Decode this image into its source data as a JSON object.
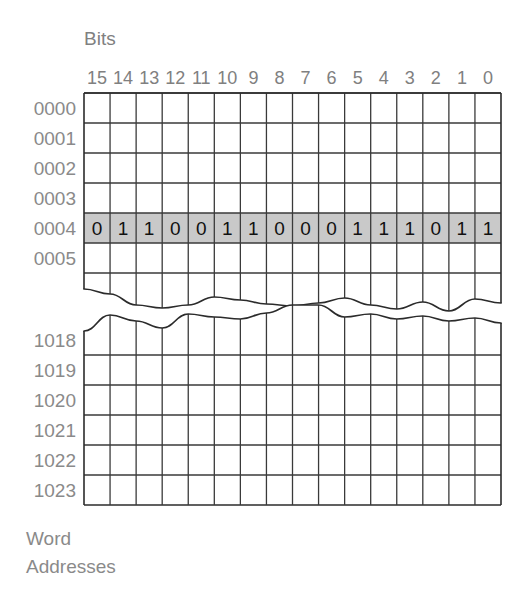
{
  "figure": {
    "bits_header": "Bits",
    "word_addresses_label_line1": "Word",
    "word_addresses_label_line2": "Addresses"
  },
  "colors": {
    "background": "#ffffff",
    "grid_line": "#3a3a3a",
    "outer_line": "#2b2b2b",
    "highlight_fill": "#c9c9c9",
    "label_text": "#8a8a8a",
    "bit_text": "#111111"
  },
  "bit_numbers": [
    "15",
    "14",
    "13",
    "12",
    "11",
    "10",
    "9",
    "8",
    "7",
    "6",
    "5",
    "4",
    "3",
    "2",
    "1",
    "0"
  ],
  "top_block": {
    "addresses": [
      "0000",
      "0001",
      "0002",
      "0003",
      "0004",
      "0005"
    ],
    "highlighted_address": "0004",
    "highlighted_row_index": 4,
    "highlighted_bits": [
      "0",
      "1",
      "1",
      "0",
      "0",
      "1",
      "1",
      "0",
      "0",
      "0",
      "1",
      "1",
      "1",
      "0",
      "1",
      "1"
    ],
    "highlighted_word": "0110011000111011"
  },
  "bottom_block": {
    "addresses": [
      "1018",
      "1019",
      "1020",
      "1021",
      "1022",
      "1023"
    ]
  }
}
